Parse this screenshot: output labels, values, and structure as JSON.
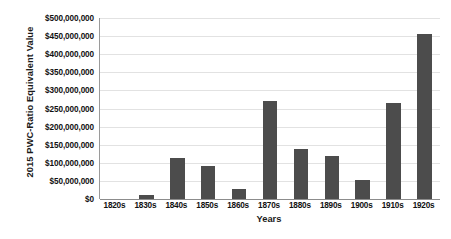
{
  "chart_data": {
    "type": "bar",
    "title": "",
    "xlabel": "Years",
    "ylabel": "2015 PWC-Ratio Equivalent Value",
    "categories": [
      "1820s",
      "1830s",
      "1840s",
      "1850s",
      "1860s",
      "1870s",
      "1880s",
      "1890s",
      "1900s",
      "1910s",
      "1920s"
    ],
    "values": [
      0,
      10000000,
      113000000,
      90000000,
      28000000,
      270000000,
      138000000,
      120000000,
      53000000,
      265000000,
      455000000
    ],
    "ylim": [
      0,
      500000000
    ],
    "ytick_values": [
      500000000,
      450000000,
      400000000,
      350000000,
      300000000,
      250000000,
      200000000,
      150000000,
      100000000,
      50000000,
      0
    ],
    "ytick_labels": [
      "$500,000,000",
      "$450,000,000",
      "$400,000,000",
      "$350,000,000",
      "$300,000,000",
      "$250,000,000",
      "$200,000,000",
      "$150,000,000",
      "$100,000,000",
      "$50,000,000",
      "$0"
    ],
    "grid": true,
    "legend": false,
    "bar_color": "#4c4c4c",
    "grid_color": "#e2e2e2",
    "axis_color": "#8c8c8c",
    "background_color": "#ffffff"
  }
}
